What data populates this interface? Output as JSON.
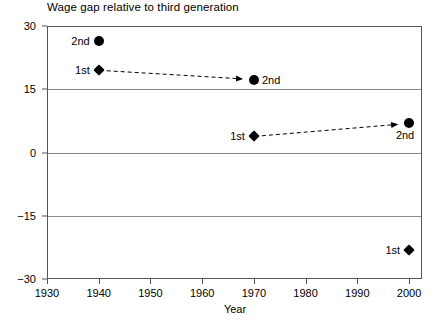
{
  "chart_data": {
    "type": "scatter",
    "title": "Wage gap relative to third generation",
    "xlabel": "Year",
    "ylabel": "Percent",
    "xlim": [
      1930,
      2002.5
    ],
    "ylim": [
      -30,
      30
    ],
    "xticks": [
      1930,
      1940,
      1950,
      1960,
      1970,
      1980,
      1990,
      2000
    ],
    "xtick_labels": [
      "1930",
      "1940",
      "1950",
      "1960",
      "1970",
      "1980",
      "1990",
      "2000"
    ],
    "yticks": [
      30,
      15,
      0,
      -15,
      -30
    ],
    "ytick_labels": [
      "30",
      "15",
      "0",
      "−15",
      "−30"
    ],
    "gridlines": [
      15,
      0,
      -15
    ],
    "grid": true,
    "legend": "none",
    "points": [
      {
        "id": "p1",
        "label": "2nd",
        "marker": "circle",
        "x": 1940,
        "y": 26.5,
        "label_pos": "left"
      },
      {
        "id": "p2",
        "label": "1st",
        "marker": "diamond",
        "x": 1940,
        "y": 19.5,
        "label_pos": "left"
      },
      {
        "id": "p3",
        "label": "2nd",
        "marker": "circle",
        "x": 1970,
        "y": 17.3,
        "label_pos": "right"
      },
      {
        "id": "p4",
        "label": "1st",
        "marker": "diamond",
        "x": 1970,
        "y": 3.8,
        "label_pos": "left"
      },
      {
        "id": "p5",
        "label": "2nd",
        "marker": "circle",
        "x": 2000,
        "y": 6.9,
        "label_pos": "below"
      },
      {
        "id": "p6",
        "label": "1st",
        "marker": "diamond",
        "x": 2000,
        "y": -23.1,
        "label_pos": "left"
      }
    ],
    "arrows": [
      {
        "from": "p2",
        "to": "p3",
        "style": "dashed"
      },
      {
        "from": "p4",
        "to": "p5",
        "style": "dashed"
      }
    ],
    "colors": {
      "marker": "#000000",
      "frame": "#555555",
      "grid": "#8a8a8a",
      "background": "#ffffff"
    }
  }
}
